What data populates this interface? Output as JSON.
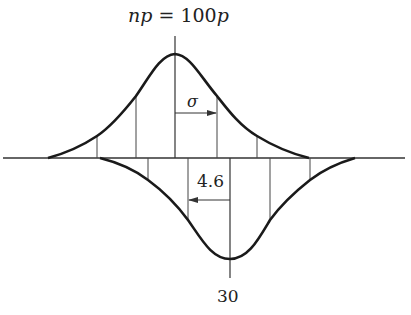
{
  "diagram": {
    "title": {
      "left": "np",
      "eq": " = ",
      "num": "100",
      "right": "p"
    },
    "labels": {
      "sigma": "σ",
      "shift": "4.6",
      "mean_value": "30"
    },
    "colors": {
      "stroke": "#1a1a1a",
      "thin": "#333333",
      "background": "#ffffff"
    },
    "upper_curve": {
      "peak_x": 175,
      "peak_y": 54,
      "left_tail_x": 48,
      "right_tail_x": 309,
      "sigma_lines_x": [
        97,
        136,
        175,
        217,
        257
      ]
    },
    "lower_curve": {
      "trough_x": 230,
      "trough_y": 259,
      "left_tail_x": 100,
      "right_tail_x": 355,
      "sigma_lines_x": [
        148,
        188,
        230,
        270,
        310
      ]
    },
    "baseline_y": 158
  }
}
